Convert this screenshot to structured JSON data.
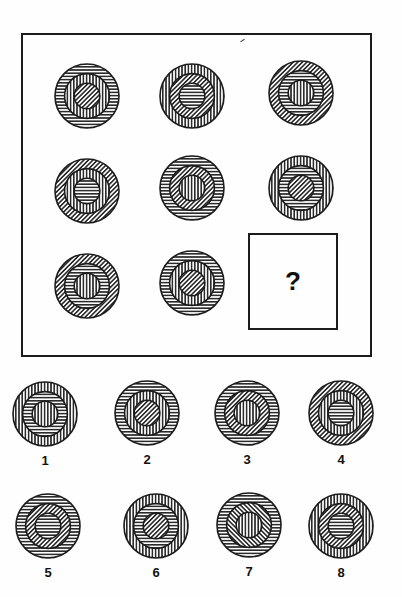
{
  "puzzle": {
    "question_mark": "?",
    "colors": {
      "ink": "#1c1c1c",
      "paper": "#fefefe"
    },
    "grid": [
      {
        "cell": "r1c1",
        "cx": 87,
        "cy": 96,
        "outer": "horizontal",
        "middle": "vertical",
        "inner": "diagonal"
      },
      {
        "cell": "r1c2",
        "cx": 192,
        "cy": 96,
        "outer": "vertical",
        "middle": "diagonal",
        "inner": "horizontal"
      },
      {
        "cell": "r1c3",
        "cx": 301,
        "cy": 93,
        "outer": "diagonal",
        "middle": "horizontal",
        "inner": "vertical"
      },
      {
        "cell": "r2c1",
        "cx": 87,
        "cy": 191,
        "outer": "diagonal",
        "middle": "vertical",
        "inner": "horizontal"
      },
      {
        "cell": "r2c2",
        "cx": 192,
        "cy": 188,
        "outer": "horizontal",
        "middle": "diagonal",
        "inner": "vertical"
      },
      {
        "cell": "r2c3",
        "cx": 301,
        "cy": 188,
        "outer": "vertical",
        "middle": "horizontal",
        "inner": "diagonal"
      },
      {
        "cell": "r3c1",
        "cx": 87,
        "cy": 286,
        "outer": "diagonal",
        "middle": "horizontal",
        "inner": "vertical"
      },
      {
        "cell": "r3c2",
        "cx": 192,
        "cy": 283,
        "outer": "horizontal",
        "middle": "vertical",
        "inner": "diagonal"
      }
    ],
    "options": [
      {
        "label": "1",
        "cx": 45,
        "cy": 414,
        "outer": "vertical",
        "middle": "horizontal",
        "inner": "vertical"
      },
      {
        "label": "2",
        "cx": 147,
        "cy": 413,
        "outer": "horizontal",
        "middle": "vertical",
        "inner": "diagonal"
      },
      {
        "label": "3",
        "cx": 247,
        "cy": 413,
        "outer": "horizontal",
        "middle": "diagonal",
        "inner": "vertical"
      },
      {
        "label": "4",
        "cx": 341,
        "cy": 413,
        "outer": "diagonal",
        "middle": "vertical",
        "inner": "horizontal"
      },
      {
        "label": "5",
        "cx": 48,
        "cy": 526,
        "outer": "horizontal",
        "middle": "diagonal",
        "inner": "horizontal"
      },
      {
        "label": "6",
        "cx": 156,
        "cy": 526,
        "outer": "vertical",
        "middle": "horizontal",
        "inner": "diagonal"
      },
      {
        "label": "7",
        "cx": 249,
        "cy": 525,
        "outer": "horizontal",
        "middle": "diagonal-back",
        "inner": "vertical"
      },
      {
        "label": "8",
        "cx": 341,
        "cy": 526,
        "outer": "vertical",
        "middle": "diagonal",
        "inner": "horizontal"
      }
    ]
  }
}
